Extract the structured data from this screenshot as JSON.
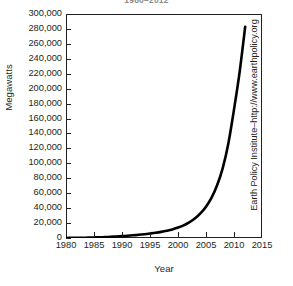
{
  "figure": {
    "title": "1980–2012",
    "y_axis_title": "Megawatts",
    "x_axis_title": "Year",
    "source_credit": "Earth Policy Institute–http://www.earthpolicy.org",
    "frame_color": "#231f20",
    "curve_color": "#000000"
  },
  "chart_data": {
    "type": "line",
    "title": "1980–2012",
    "xlabel": "Year",
    "ylabel": "Megawatts",
    "xlim": [
      1980,
      2015
    ],
    "ylim": [
      0,
      300000
    ],
    "grid": false,
    "legend": null,
    "xticks": [
      1980,
      1985,
      1990,
      1995,
      2000,
      2005,
      2010,
      2015
    ],
    "xtick_labels": [
      "1980",
      "1985",
      "1990",
      "1995",
      "2000",
      "2005",
      "2010",
      "2015"
    ],
    "yticks": [
      0,
      20000,
      40000,
      60000,
      80000,
      100000,
      120000,
      140000,
      160000,
      180000,
      200000,
      220000,
      240000,
      260000,
      280000,
      300000
    ],
    "ytick_labels": [
      "0",
      "20,000",
      "40,000",
      "60,000",
      "80,000",
      "100,000",
      "120,000",
      "140,000",
      "160,000",
      "180,000",
      "200,000",
      "220,000",
      "240,000",
      "260,000",
      "280,000",
      "300,000"
    ],
    "series": [
      {
        "name": "Cumulative installed capacity",
        "x": [
          1980,
          1981,
          1982,
          1983,
          1984,
          1985,
          1986,
          1987,
          1988,
          1989,
          1990,
          1991,
          1992,
          1993,
          1994,
          1995,
          1996,
          1997,
          1998,
          1999,
          2000,
          2001,
          2002,
          2003,
          2004,
          2005,
          2006,
          2007,
          2008,
          2009,
          2010,
          2011,
          2012
        ],
        "values": [
          90,
          150,
          240,
          350,
          500,
          700,
          950,
          1250,
          1600,
          2000,
          2500,
          3000,
          3600,
          4300,
          5100,
          6000,
          7000,
          8200,
          9700,
          11500,
          14000,
          17000,
          21000,
          26000,
          33000,
          42000,
          54000,
          71000,
          94000,
          127000,
          172000,
          222000,
          283000
        ]
      }
    ],
    "annotations": [],
    "final_value": 283000,
    "final_year": 2012
  }
}
